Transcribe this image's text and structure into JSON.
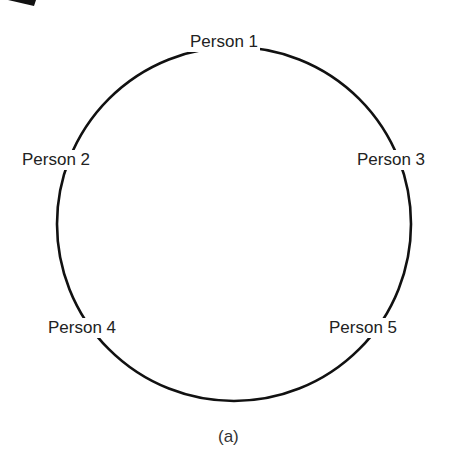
{
  "diagram": {
    "type": "ring",
    "nodes": [
      {
        "id": "p1",
        "label": "Person 1"
      },
      {
        "id": "p2",
        "label": "Person 2"
      },
      {
        "id": "p3",
        "label": "Person 3"
      },
      {
        "id": "p4",
        "label": "Person 4"
      },
      {
        "id": "p5",
        "label": "Person 5"
      }
    ],
    "caption": "(a)",
    "colors": {
      "stroke": "#111111",
      "text": "#222222",
      "background": "#ffffff"
    }
  }
}
